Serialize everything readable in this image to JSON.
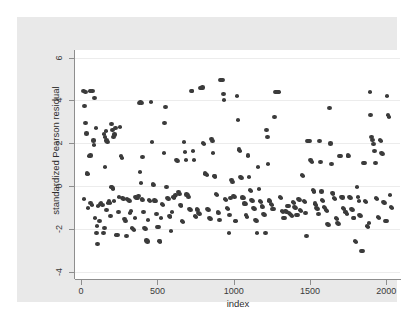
{
  "chart_data": {
    "type": "scatter",
    "title": "",
    "xlabel": "index",
    "ylabel": "standardized Pearson residual",
    "xlim": [
      -40,
      2090
    ],
    "ylim": [
      -4.35,
      6.35
    ],
    "xticks": [
      0,
      500,
      1000,
      1500,
      2000
    ],
    "yticks": [
      6,
      4,
      2,
      0,
      -2,
      -4
    ],
    "xtick_labels": [
      "0",
      "500",
      "1000",
      "1500",
      "2000"
    ],
    "ytick_labels": [
      "6",
      "4",
      "2",
      "0",
      "-2",
      "-4"
    ],
    "grid": "horizontal",
    "legend": "none",
    "marker": {
      "shape": "circle",
      "color": "#3b3b3b",
      "size": 4.4
    },
    "background": {
      "graph_region": "#e9e9e9",
      "plot_region": "#ffffff",
      "gridline": "#ececec",
      "axis": "#8e8e8e"
    },
    "n_points": 330,
    "points": [
      [
        15,
        4.42
      ],
      [
        28,
        4.4
      ],
      [
        40,
        0.58
      ],
      [
        44,
        0.54
      ],
      [
        30,
        2.95
      ],
      [
        36,
        2.45
      ],
      [
        22,
        3.72
      ],
      [
        18,
        -0.62
      ],
      [
        58,
        4.45
      ],
      [
        66,
        4.44
      ],
      [
        74,
        4.45
      ],
      [
        52,
        1.4
      ],
      [
        60,
        1.42
      ],
      [
        46,
        -1.05
      ],
      [
        62,
        -0.78
      ],
      [
        70,
        -0.88
      ],
      [
        88,
        4.12
      ],
      [
        96,
        2.7
      ],
      [
        80,
        2.12
      ],
      [
        84,
        1.9
      ],
      [
        92,
        -1.48
      ],
      [
        100,
        -2.18
      ],
      [
        108,
        -2.72
      ],
      [
        112,
        -0.92
      ],
      [
        104,
        -1.88
      ],
      [
        120,
        -1.62
      ],
      [
        128,
        -0.86
      ],
      [
        132,
        -0.82
      ],
      [
        140,
        -0.9
      ],
      [
        150,
        2.42
      ],
      [
        156,
        2.3
      ],
      [
        162,
        2.55
      ],
      [
        168,
        2.12
      ],
      [
        172,
        2.06
      ],
      [
        158,
        0.88
      ],
      [
        146,
        -2.22
      ],
      [
        152,
        -1.98
      ],
      [
        166,
        -1.12
      ],
      [
        176,
        -0.78
      ],
      [
        182,
        -0.7
      ],
      [
        188,
        -0.8
      ],
      [
        194,
        -1.42
      ],
      [
        200,
        2.88
      ],
      [
        206,
        2.62
      ],
      [
        212,
        2.3
      ],
      [
        218,
        2.4
      ],
      [
        224,
        2.7
      ],
      [
        196,
        -0.06
      ],
      [
        202,
        -0.04
      ],
      [
        208,
        -0.12
      ],
      [
        214,
        -0.7
      ],
      [
        230,
        -2.3
      ],
      [
        238,
        -2.28
      ],
      [
        244,
        -1.22
      ],
      [
        250,
        -0.52
      ],
      [
        256,
        2.76
      ],
      [
        262,
        1.38
      ],
      [
        268,
        1.3
      ],
      [
        272,
        -0.58
      ],
      [
        278,
        -0.62
      ],
      [
        284,
        -1.55
      ],
      [
        290,
        -1.65
      ],
      [
        296,
        -2.35
      ],
      [
        302,
        -0.6
      ],
      [
        310,
        -0.64
      ],
      [
        316,
        -0.7
      ],
      [
        322,
        -1.28
      ],
      [
        328,
        -1.18
      ],
      [
        334,
        -1.95
      ],
      [
        340,
        -2.0
      ],
      [
        346,
        -2.04
      ],
      [
        352,
        -1.5
      ],
      [
        358,
        -0.52
      ],
      [
        364,
        -0.56
      ],
      [
        370,
        -0.58
      ],
      [
        376,
        -0.48
      ],
      [
        382,
        3.88
      ],
      [
        390,
        3.9
      ],
      [
        396,
        3.88
      ],
      [
        402,
        1.35
      ],
      [
        386,
        0.66
      ],
      [
        392,
        0.12
      ],
      [
        398,
        -0.6
      ],
      [
        404,
        -0.66
      ],
      [
        410,
        -1.2
      ],
      [
        416,
        -1.98
      ],
      [
        422,
        -2.02
      ],
      [
        428,
        -2.55
      ],
      [
        434,
        -2.6
      ],
      [
        440,
        -1.6
      ],
      [
        446,
        -0.66
      ],
      [
        452,
        -0.7
      ],
      [
        458,
        3.9
      ],
      [
        464,
        2.04
      ],
      [
        470,
        0.08
      ],
      [
        476,
        0.04
      ],
      [
        482,
        -0.68
      ],
      [
        488,
        -0.72
      ],
      [
        494,
        -1.3
      ],
      [
        500,
        -1.9
      ],
      [
        506,
        -1.94
      ],
      [
        512,
        -2.58
      ],
      [
        518,
        -2.6
      ],
      [
        524,
        -1.52
      ],
      [
        530,
        -0.86
      ],
      [
        536,
        -0.9
      ],
      [
        542,
        1.55
      ],
      [
        548,
        2.96
      ],
      [
        554,
        3.7
      ],
      [
        560,
        -0.04
      ],
      [
        566,
        -0.55
      ],
      [
        572,
        -0.6
      ],
      [
        578,
        -1.4
      ],
      [
        584,
        -1.45
      ],
      [
        590,
        -2.12
      ],
      [
        596,
        -1.2
      ],
      [
        602,
        -0.5
      ],
      [
        608,
        -0.54
      ],
      [
        614,
        -0.46
      ],
      [
        620,
        -0.42
      ],
      [
        626,
        1.22
      ],
      [
        632,
        1.18
      ],
      [
        638,
        -0.3
      ],
      [
        644,
        -0.36
      ],
      [
        650,
        -0.9
      ],
      [
        656,
        -0.96
      ],
      [
        662,
        -1.65
      ],
      [
        668,
        -1.7
      ],
      [
        674,
        2.04
      ],
      [
        680,
        1.58
      ],
      [
        686,
        1.22
      ],
      [
        692,
        -0.4
      ],
      [
        698,
        -0.44
      ],
      [
        704,
        -0.52
      ],
      [
        710,
        -1.08
      ],
      [
        716,
        -1.12
      ],
      [
        722,
        4.44
      ],
      [
        728,
        4.42
      ],
      [
        734,
        1.62
      ],
      [
        740,
        1.2
      ],
      [
        746,
        -1.4
      ],
      [
        752,
        -1.46
      ],
      [
        758,
        -1.08
      ],
      [
        764,
        -1.14
      ],
      [
        770,
        -1.28
      ],
      [
        776,
        -1.32
      ],
      [
        782,
        4.56
      ],
      [
        788,
        4.58
      ],
      [
        794,
        4.6
      ],
      [
        800,
        2.0
      ],
      [
        806,
        1.96
      ],
      [
        812,
        0.58
      ],
      [
        818,
        0.56
      ],
      [
        824,
        0.52
      ],
      [
        830,
        -1.1
      ],
      [
        836,
        -1.14
      ],
      [
        842,
        -1.5
      ],
      [
        848,
        -1.55
      ],
      [
        854,
        2.18
      ],
      [
        860,
        2.1
      ],
      [
        866,
        1.52
      ],
      [
        872,
        0.48
      ],
      [
        878,
        0.44
      ],
      [
        884,
        -0.36
      ],
      [
        890,
        -0.42
      ],
      [
        896,
        -1.2
      ],
      [
        902,
        -1.26
      ],
      [
        908,
        -1.58
      ],
      [
        914,
        4.96
      ],
      [
        920,
        4.94
      ],
      [
        926,
        4.95
      ],
      [
        932,
        4.28
      ],
      [
        938,
        4.02
      ],
      [
        944,
        -0.62
      ],
      [
        950,
        -0.66
      ],
      [
        956,
        -1.02
      ],
      [
        962,
        -1.06
      ],
      [
        968,
        -2.22
      ],
      [
        974,
        -1.34
      ],
      [
        980,
        -0.58
      ],
      [
        986,
        0.26
      ],
      [
        992,
        0.2
      ],
      [
        998,
        -0.48
      ],
      [
        1004,
        -0.52
      ],
      [
        1010,
        -1.62
      ],
      [
        1016,
        -1.66
      ],
      [
        1022,
        4.22
      ],
      [
        1028,
        3.1
      ],
      [
        1034,
        1.7
      ],
      [
        1040,
        1.64
      ],
      [
        1046,
        0.42
      ],
      [
        1052,
        0.38
      ],
      [
        1058,
        -0.54
      ],
      [
        1064,
        -0.58
      ],
      [
        1070,
        -0.82
      ],
      [
        1076,
        -0.86
      ],
      [
        1082,
        -1.38
      ],
      [
        1088,
        -1.44
      ],
      [
        1094,
        1.42
      ],
      [
        1100,
        0.4
      ],
      [
        1106,
        -0.18
      ],
      [
        1112,
        -0.24
      ],
      [
        1118,
        -0.64
      ],
      [
        1124,
        -0.7
      ],
      [
        1130,
        -1.02
      ],
      [
        1136,
        -1.06
      ],
      [
        1142,
        -1.58
      ],
      [
        1148,
        -1.62
      ],
      [
        1154,
        -2.22
      ],
      [
        1160,
        0.88
      ],
      [
        1166,
        -0.14
      ],
      [
        1172,
        -0.7
      ],
      [
        1178,
        -0.74
      ],
      [
        1184,
        -0.96
      ],
      [
        1190,
        -1.0
      ],
      [
        1196,
        -1.3
      ],
      [
        1202,
        -1.34
      ],
      [
        1208,
        -2.22
      ],
      [
        1214,
        2.62
      ],
      [
        1220,
        2.3
      ],
      [
        1226,
        1.04
      ],
      [
        1232,
        -0.68
      ],
      [
        1238,
        -0.72
      ],
      [
        1244,
        -0.86
      ],
      [
        1250,
        -0.9
      ],
      [
        1256,
        -1.06
      ],
      [
        1262,
        -1.1
      ],
      [
        1268,
        3.2
      ],
      [
        1274,
        4.38
      ],
      [
        1280,
        4.38
      ],
      [
        1286,
        4.4
      ],
      [
        1292,
        4.38
      ],
      [
        1298,
        4.4
      ],
      [
        1304,
        -0.52
      ],
      [
        1310,
        -0.56
      ],
      [
        1316,
        -1.16
      ],
      [
        1322,
        -1.2
      ],
      [
        1328,
        -1.48
      ],
      [
        1334,
        -1.52
      ],
      [
        1340,
        -1.16
      ],
      [
        1346,
        -1.2
      ],
      [
        1352,
        -0.92
      ],
      [
        1358,
        -0.96
      ],
      [
        1364,
        -1.28
      ],
      [
        1370,
        -1.32
      ],
      [
        1376,
        -1.38
      ],
      [
        1382,
        -1.42
      ],
      [
        1388,
        -0.74
      ],
      [
        1394,
        -0.78
      ],
      [
        1400,
        -1.0
      ],
      [
        1406,
        -1.04
      ],
      [
        1412,
        -1.34
      ],
      [
        1418,
        -1.38
      ],
      [
        1424,
        -0.62
      ],
      [
        1430,
        -0.66
      ],
      [
        1436,
        -1.14
      ],
      [
        1442,
        -1.18
      ],
      [
        1448,
        0.5
      ],
      [
        1454,
        0.46
      ],
      [
        1460,
        -0.7
      ],
      [
        1466,
        -0.74
      ],
      [
        1472,
        -1.26
      ],
      [
        1478,
        -2.32
      ],
      [
        1484,
        2.1
      ],
      [
        1490,
        2.08
      ],
      [
        1496,
        2.1
      ],
      [
        1502,
        1.22
      ],
      [
        1508,
        1.18
      ],
      [
        1514,
        1.1
      ],
      [
        1520,
        -0.2
      ],
      [
        1526,
        -0.26
      ],
      [
        1532,
        -0.82
      ],
      [
        1538,
        -0.88
      ],
      [
        1544,
        -1.04
      ],
      [
        1550,
        -1.08
      ],
      [
        1556,
        -1.32
      ],
      [
        1562,
        2.08
      ],
      [
        1568,
        1.1
      ],
      [
        1574,
        -0.26
      ],
      [
        1580,
        -0.66
      ],
      [
        1586,
        -0.7
      ],
      [
        1592,
        -1.0
      ],
      [
        1598,
        -1.04
      ],
      [
        1604,
        -1.12
      ],
      [
        1610,
        -1.16
      ],
      [
        1616,
        -1.78
      ],
      [
        1622,
        -1.82
      ],
      [
        1628,
        3.66
      ],
      [
        1634,
        1.98
      ],
      [
        1640,
        1.04
      ],
      [
        1646,
        -0.32
      ],
      [
        1652,
        -0.36
      ],
      [
        1658,
        -0.56
      ],
      [
        1664,
        -0.6
      ],
      [
        1670,
        -1.52
      ],
      [
        1676,
        -1.56
      ],
      [
        1682,
        -1.74
      ],
      [
        1688,
        -1.78
      ],
      [
        1694,
        1.4
      ],
      [
        1700,
        1.38
      ],
      [
        1706,
        -0.5
      ],
      [
        1712,
        -0.54
      ],
      [
        1718,
        -1.02
      ],
      [
        1724,
        -1.06
      ],
      [
        1730,
        -1.2
      ],
      [
        1736,
        -1.24
      ],
      [
        1742,
        -1.3
      ],
      [
        1748,
        1.42
      ],
      [
        1754,
        1.4
      ],
      [
        1760,
        -0.52
      ],
      [
        1766,
        -0.58
      ],
      [
        1772,
        -1.1
      ],
      [
        1778,
        -1.14
      ],
      [
        1784,
        -1.48
      ],
      [
        1790,
        -1.52
      ],
      [
        1796,
        -2.58
      ],
      [
        1802,
        -2.62
      ],
      [
        1808,
        -0.06
      ],
      [
        1814,
        -0.52
      ],
      [
        1820,
        -0.7
      ],
      [
        1826,
        -1.38
      ],
      [
        1832,
        -1.42
      ],
      [
        1838,
        -3.04
      ],
      [
        1844,
        -3.06
      ],
      [
        1850,
        1.08
      ],
      [
        1856,
        1.06
      ],
      [
        1862,
        -0.7
      ],
      [
        1868,
        -0.74
      ],
      [
        1874,
        -1.88
      ],
      [
        1880,
        -1.92
      ],
      [
        1886,
        -1.72
      ],
      [
        1892,
        4.4
      ],
      [
        1898,
        3.32
      ],
      [
        1904,
        2.3
      ],
      [
        1910,
        2.14
      ],
      [
        1916,
        1.94
      ],
      [
        1922,
        1.62
      ],
      [
        1928,
        1.08
      ],
      [
        1934,
        -0.58
      ],
      [
        1940,
        -0.62
      ],
      [
        1946,
        -1.46
      ],
      [
        1952,
        -1.5
      ],
      [
        1958,
        2.16
      ],
      [
        1964,
        2.1
      ],
      [
        1970,
        1.52
      ],
      [
        1976,
        1.48
      ],
      [
        1982,
        -0.74
      ],
      [
        1988,
        -0.78
      ],
      [
        1994,
        -1.62
      ],
      [
        2000,
        -1.66
      ],
      [
        2006,
        4.18
      ],
      [
        2012,
        3.3
      ],
      [
        2018,
        3.22
      ],
      [
        2024,
        -0.42
      ],
      [
        2030,
        -1.0
      ],
      [
        2036,
        -1.04
      ]
    ]
  }
}
